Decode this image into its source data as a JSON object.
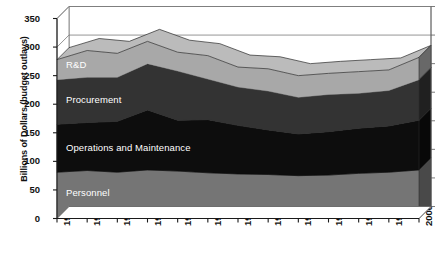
{
  "chart_data": {
    "type": "area",
    "stacked": true,
    "title": "",
    "subtitle": "",
    "xlabel": "",
    "ylabel": "Billions of Dollars (budget outlays)",
    "x": [
      "1988",
      "1989",
      "1990",
      "1991",
      "1992",
      "1993",
      "1994",
      "1995",
      "1996",
      "1997",
      "1998",
      "1999",
      "2000"
    ],
    "categories": [
      "1988",
      "1989",
      "1990",
      "1991",
      "1992",
      "1993",
      "1994",
      "1995",
      "1996",
      "1997",
      "1998",
      "1999",
      "2000"
    ],
    "xtick_labels": [
      "1988",
      "1989",
      "1990",
      "1991",
      "1992",
      "1993",
      "1994",
      "1995",
      "1996",
      "1997",
      "1998",
      "1999",
      "2000"
    ],
    "ytick_labels": [
      "0",
      "50",
      "100",
      "150",
      "200",
      "250",
      "300",
      "350"
    ],
    "ytick_values": [
      0,
      50,
      100,
      150,
      200,
      250,
      300,
      350
    ],
    "ylim": [
      0,
      350
    ],
    "grid": true,
    "legend_position": "in-plot-labels",
    "series": [
      {
        "name": "Personnel",
        "color": "#757575",
        "label_color": "#ffffff",
        "values": [
          81,
          84,
          81,
          85,
          83,
          80,
          78,
          77,
          75,
          76,
          79,
          81,
          85
        ]
      },
      {
        "name": "Operations and Maintenance",
        "color": "#0d0d0d",
        "label_color": "#ffffff",
        "values": [
          84,
          84,
          89,
          105,
          89,
          93,
          85,
          78,
          73,
          76,
          79,
          81,
          87
        ]
      },
      {
        "name": "Procurement",
        "color": "#333333",
        "label_color": "#ffffff",
        "values": [
          78,
          79,
          77,
          81,
          86,
          71,
          67,
          68,
          64,
          65,
          61,
          62,
          71
        ]
      },
      {
        "name": "R&D",
        "color": "#a8a8a8",
        "label_color": "#ffffff",
        "values": [
          35,
          47,
          42,
          39,
          33,
          41,
          35,
          39,
          38,
          37,
          38,
          36,
          39
        ]
      }
    ],
    "cumulative_tops": {
      "Personnel": [
        81,
        84,
        81,
        85,
        83,
        80,
        78,
        77,
        75,
        76,
        79,
        81,
        85
      ],
      "Operations and Maintenance": [
        165,
        168,
        170,
        190,
        172,
        173,
        163,
        155,
        148,
        152,
        158,
        162,
        172
      ],
      "Procurement": [
        243,
        247,
        247,
        271,
        258,
        244,
        230,
        223,
        212,
        217,
        219,
        224,
        243
      ],
      "R&D": [
        278,
        294,
        289,
        310,
        291,
        285,
        265,
        262,
        250,
        254,
        257,
        260,
        282
      ]
    },
    "series_labels": [
      {
        "name": "R&D",
        "text": "R&D"
      },
      {
        "name": "Procurement",
        "text": "Procurement"
      },
      {
        "name": "Operations and Maintenance",
        "text": "Operations and Maintenance"
      },
      {
        "name": "Personnel",
        "text": "Personnel"
      }
    ]
  }
}
